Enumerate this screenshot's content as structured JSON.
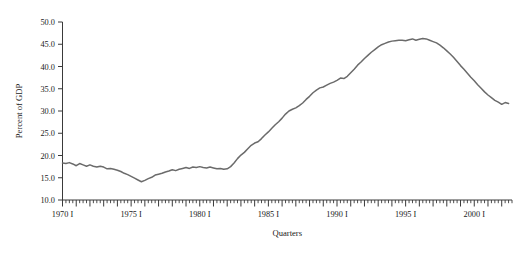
{
  "chart_data": {
    "type": "line",
    "title": "",
    "subtitle": "",
    "xlabel": "Quarters",
    "ylabel": "Percent of GDP",
    "grid": false,
    "legend": "none",
    "line_color": "#6b6b6b",
    "axis_color": "#3a3a3a",
    "background_color": "#ffffff",
    "xlim": [
      1970.0,
      2002.75
    ],
    "ylim": [
      10.0,
      50.0
    ],
    "yticks": [
      "50.0",
      "45.0",
      "40.0",
      "35.0",
      "30.0",
      "25.0",
      "20.0",
      "15.0",
      "10.0"
    ],
    "ytick_values": [
      50.0,
      45.0,
      40.0,
      35.0,
      30.0,
      25.0,
      20.0,
      15.0,
      10.0
    ],
    "xticks": [
      "1970 I",
      "1975 I",
      "1980 I",
      "1985 I",
      "1990 I",
      "1995 I",
      "2000 I"
    ],
    "xtick_values": [
      1970.0,
      1975.0,
      1980.0,
      1985.0,
      1990.0,
      1995.0,
      2000.0
    ],
    "x_minor_interval_years": 0.25,
    "x": [
      1970.0,
      1970.25,
      1970.5,
      1970.75,
      1971.0,
      1971.25,
      1971.5,
      1971.75,
      1972.0,
      1972.25,
      1972.5,
      1972.75,
      1973.0,
      1973.25,
      1973.5,
      1973.75,
      1974.0,
      1974.25,
      1974.5,
      1974.75,
      1975.0,
      1975.25,
      1975.5,
      1975.75,
      1976.0,
      1976.25,
      1976.5,
      1976.75,
      1977.0,
      1977.25,
      1977.5,
      1977.75,
      1978.0,
      1978.25,
      1978.5,
      1978.75,
      1979.0,
      1979.25,
      1979.5,
      1979.75,
      1980.0,
      1980.25,
      1980.5,
      1980.75,
      1981.0,
      1981.25,
      1981.5,
      1981.75,
      1982.0,
      1982.25,
      1982.5,
      1982.75,
      1983.0,
      1983.25,
      1983.5,
      1983.75,
      1984.0,
      1984.25,
      1984.5,
      1984.75,
      1985.0,
      1985.25,
      1985.5,
      1985.75,
      1986.0,
      1986.25,
      1986.5,
      1986.75,
      1987.0,
      1987.25,
      1987.5,
      1987.75,
      1988.0,
      1988.25,
      1988.5,
      1988.75,
      1989.0,
      1989.25,
      1989.5,
      1989.75,
      1990.0,
      1990.25,
      1990.5,
      1990.75,
      1991.0,
      1991.25,
      1991.5,
      1991.75,
      1992.0,
      1992.25,
      1992.5,
      1992.75,
      1993.0,
      1993.25,
      1993.5,
      1993.75,
      1994.0,
      1994.25,
      1994.5,
      1994.75,
      1995.0,
      1995.25,
      1995.5,
      1995.75,
      1996.0,
      1996.25,
      1996.5,
      1996.75,
      1997.0,
      1997.25,
      1997.5,
      1997.75,
      1998.0,
      1998.25,
      1998.5,
      1998.75,
      1999.0,
      1999.25,
      1999.5,
      1999.75,
      2000.0,
      2000.25,
      2000.5,
      2000.75,
      2001.0,
      2001.25,
      2001.5,
      2001.75,
      2002.0,
      2002.25,
      2002.5
    ],
    "values": [
      18.3,
      18.2,
      18.4,
      18.1,
      17.7,
      18.2,
      17.9,
      17.6,
      17.9,
      17.6,
      17.4,
      17.6,
      17.4,
      17.0,
      17.1,
      16.9,
      16.7,
      16.4,
      16.0,
      15.7,
      15.3,
      14.9,
      14.5,
      14.1,
      14.4,
      14.8,
      15.1,
      15.6,
      15.8,
      16.0,
      16.3,
      16.5,
      16.8,
      16.6,
      16.9,
      17.1,
      17.3,
      17.1,
      17.4,
      17.3,
      17.5,
      17.3,
      17.2,
      17.4,
      17.2,
      17.0,
      17.1,
      16.9,
      17.0,
      17.5,
      18.3,
      19.3,
      20.1,
      20.7,
      21.5,
      22.3,
      22.8,
      23.1,
      23.8,
      24.6,
      25.3,
      26.1,
      26.9,
      27.6,
      28.4,
      29.3,
      30.0,
      30.4,
      30.7,
      31.2,
      31.8,
      32.6,
      33.3,
      34.1,
      34.7,
      35.2,
      35.4,
      35.8,
      36.2,
      36.5,
      36.9,
      37.4,
      37.3,
      37.8,
      38.6,
      39.4,
      40.3,
      41.0,
      41.8,
      42.5,
      43.2,
      43.8,
      44.4,
      44.9,
      45.2,
      45.5,
      45.7,
      45.8,
      45.9,
      45.9,
      45.8,
      46.0,
      46.2,
      45.9,
      46.1,
      46.3,
      46.2,
      45.9,
      45.6,
      45.3,
      44.8,
      44.2,
      43.5,
      42.8,
      42.0,
      41.1,
      40.2,
      39.4,
      38.5,
      37.6,
      36.8,
      35.9,
      35.1,
      34.3,
      33.6,
      33.0,
      32.4,
      32.0,
      31.5,
      31.9,
      31.7
    ]
  }
}
